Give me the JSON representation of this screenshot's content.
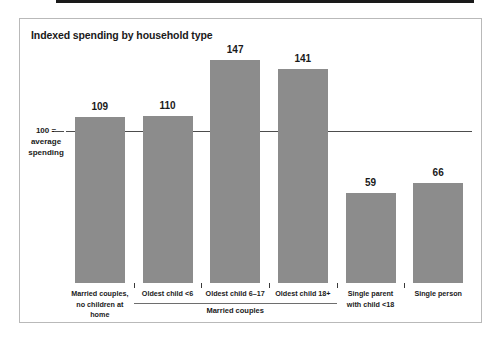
{
  "chart_data": {
    "type": "bar",
    "title": "Indexed spending by household type",
    "xlabel": "",
    "ylabel": "100 = average spending",
    "ylim": [
      0,
      160
    ],
    "grid": false,
    "legend": false,
    "reference_line": {
      "value": 100,
      "label_lines": [
        "100 =",
        "average",
        "spending"
      ]
    },
    "categories": [
      "Married couples,\nno children at home",
      "Oldest child <6",
      "Oldest child 6–17",
      "Oldest child 18+",
      "Single parent\nwith child <18",
      "Single person"
    ],
    "category_lines": [
      [
        "Married couples,",
        "no children at home"
      ],
      [
        "Oldest child <6"
      ],
      [
        "Oldest child 6–17"
      ],
      [
        "Oldest child 18+"
      ],
      [
        "Single parent",
        "with child <18"
      ],
      [
        "Single person"
      ]
    ],
    "values": [
      109,
      110,
      147,
      141,
      59,
      66
    ],
    "group_annotations": [
      {
        "label": "Married couples",
        "spans_categories": [
          1,
          2,
          3
        ]
      }
    ],
    "colors": {
      "bar": "#8c8c8c",
      "reference_line": "#4d4d4d",
      "baseline": "#1a1a1a",
      "text": "#1a1a1a",
      "frame": "#b9b9b9",
      "background": "#ffffff"
    }
  }
}
